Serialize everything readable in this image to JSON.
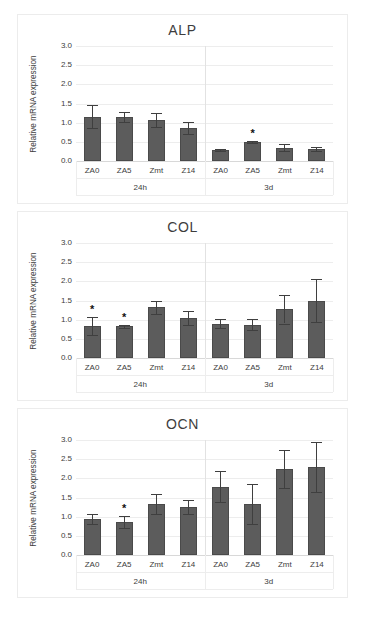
{
  "figure": {
    "y_axis_label": "Relative mRNA expression",
    "y_ticks": [
      "3.0",
      "2.5",
      "2.0",
      "1.5",
      "1.0",
      "0.5",
      "0.0"
    ],
    "group_labels": [
      "24h",
      "3d"
    ],
    "significance_marker": "*",
    "bar_color": "#5c5c5c",
    "grid_color": "#ededed",
    "axis_color": "#c9c9c9"
  },
  "chart_data": [
    {
      "type": "bar",
      "title": "ALP",
      "xlabel": "",
      "ylabel": "Relative mRNA expression",
      "ylim": [
        0,
        3.0
      ],
      "ytick_step": 0.5,
      "grid": true,
      "legend": "none",
      "groups": [
        "24h",
        "3d"
      ],
      "categories": [
        "ZA0",
        "ZA5",
        "Zmt",
        "Z14",
        "ZA0",
        "ZA5",
        "Zmt",
        "Z14"
      ],
      "values": [
        1.16,
        1.15,
        1.07,
        0.86,
        0.29,
        0.49,
        0.35,
        0.31
      ],
      "errors": [
        0.3,
        0.13,
        0.19,
        0.16,
        0.02,
        0.03,
        0.09,
        0.05
      ],
      "significant": [
        false,
        false,
        false,
        false,
        false,
        true,
        false,
        false
      ]
    },
    {
      "type": "bar",
      "title": "COL",
      "xlabel": "",
      "ylabel": "Relative mRNA expression",
      "ylim": [
        0,
        3.0
      ],
      "ytick_step": 0.5,
      "grid": true,
      "legend": "none",
      "groups": [
        "24h",
        "3d"
      ],
      "categories": [
        "ZA0",
        "ZA5",
        "Zmt",
        "Z14",
        "ZA0",
        "ZA5",
        "Zmt",
        "Z14"
      ],
      "values": [
        0.83,
        0.83,
        1.32,
        1.05,
        0.9,
        0.87,
        1.27,
        1.5
      ],
      "errors": [
        0.23,
        0.04,
        0.18,
        0.18,
        0.13,
        0.15,
        0.37,
        0.55
      ],
      "significant": [
        true,
        true,
        false,
        false,
        false,
        false,
        false,
        false
      ]
    },
    {
      "type": "bar",
      "title": "OCN",
      "xlabel": "",
      "ylabel": "Relative mRNA expression",
      "ylim": [
        0,
        3.0
      ],
      "ytick_step": 0.5,
      "grid": true,
      "legend": "none",
      "groups": [
        "24h",
        "3d"
      ],
      "categories": [
        "ZA0",
        "ZA5",
        "Zmt",
        "Z14",
        "ZA0",
        "ZA5",
        "Zmt",
        "Z14"
      ],
      "values": [
        0.93,
        0.86,
        1.33,
        1.25,
        1.78,
        1.34,
        2.25,
        2.3
      ],
      "errors": [
        0.13,
        0.16,
        0.26,
        0.19,
        0.4,
        0.52,
        0.5,
        0.65
      ],
      "significant": [
        false,
        true,
        false,
        false,
        false,
        false,
        false,
        false
      ]
    }
  ]
}
